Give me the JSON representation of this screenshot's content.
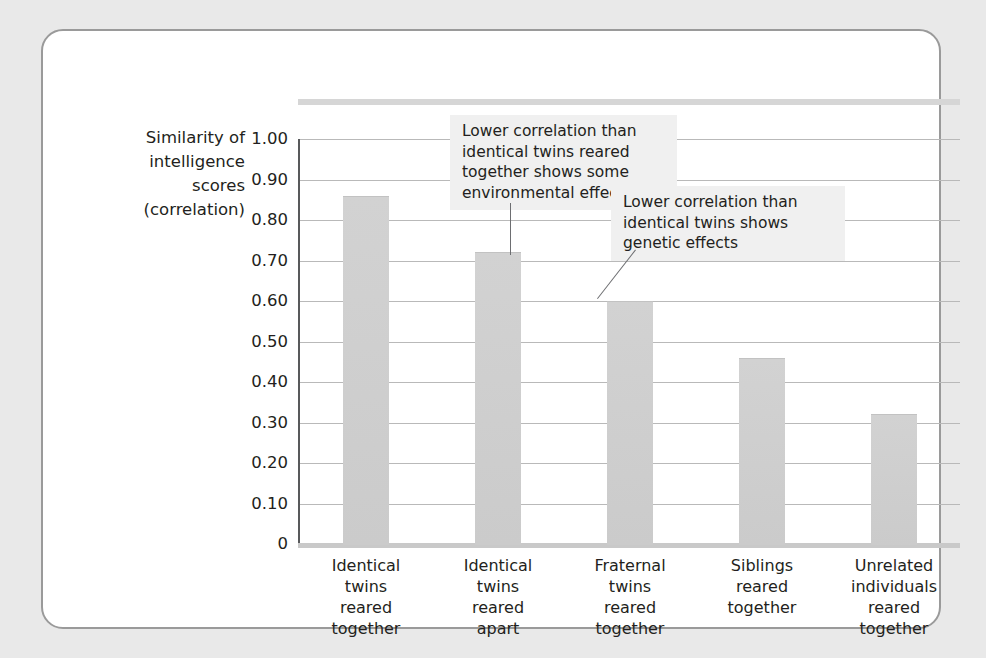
{
  "figure": {
    "background_color": "#e9e9e9",
    "card_color": "#ffffff",
    "card_border_color": "#9a9a9a",
    "bar_color": "#cfcfcf",
    "gridline_color": "#b9b9b9",
    "axis_color": "#58595b",
    "callout_background": "#f0f0f0"
  },
  "axis_title": "Similarity of\nintelligence\nscores\n(correlation)",
  "y_ticks": [
    "1.00",
    "0.90",
    "0.80",
    "0.70",
    "0.60",
    "0.50",
    "0.40",
    "0.30",
    "0.20",
    "0.10",
    "0"
  ],
  "x_labels": [
    "Identical\ntwins\nreared\ntogether",
    "Identical\ntwins\nreared\napart",
    "Fraternal\ntwins\nreared\ntogether",
    "Siblings\nreared\ntogether",
    "Unrelated\nindividuals\nreared\ntogether"
  ],
  "callouts": [
    {
      "id": "callout-environmental-effect",
      "text": "Lower correlation than\nidentical twins reared\ntogether shows some\nenvironmental effect"
    },
    {
      "id": "callout-genetic-effects",
      "text": "Lower correlation than\nidentical twins shows\ngenetic effects"
    }
  ],
  "chart_data": {
    "type": "bar",
    "title": "",
    "xlabel": "",
    "ylabel": "Similarity of intelligence scores (correlation)",
    "ylim": [
      0,
      1.0
    ],
    "ytick_values": [
      1.0,
      0.9,
      0.8,
      0.7,
      0.6,
      0.5,
      0.4,
      0.3,
      0.2,
      0.1,
      0
    ],
    "grid": true,
    "legend": "none",
    "categories": [
      "Identical twins reared together",
      "Identical twins reared apart",
      "Fraternal twins reared together",
      "Siblings reared together",
      "Unrelated individuals reared together"
    ],
    "values": [
      0.86,
      0.72,
      0.6,
      0.46,
      0.32
    ],
    "annotations": [
      {
        "target_category": "Identical twins reared apart",
        "text": "Lower correlation than identical twins reared together shows some environmental effect"
      },
      {
        "target_category": "Fraternal twins reared together",
        "text": "Lower correlation than identical twins shows genetic effects"
      }
    ]
  }
}
